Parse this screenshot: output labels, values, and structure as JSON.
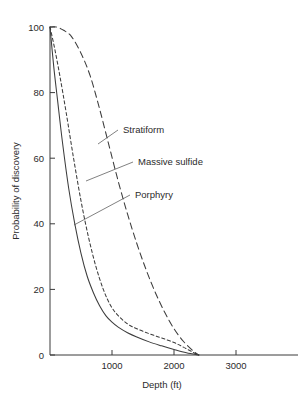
{
  "chart_data": {
    "type": "line",
    "title": "",
    "xlabel": "Depth (ft)",
    "ylabel": "Probability of discovery",
    "xlim": [
      0,
      4000
    ],
    "ylim": [
      0,
      100
    ],
    "xticks": [
      1000,
      2000,
      3000
    ],
    "xtick_labels": [
      "1000",
      "2000",
      "3000"
    ],
    "yticks": [
      0,
      20,
      40,
      60,
      80,
      100
    ],
    "ytick_labels": [
      "0",
      "20",
      "40",
      "60",
      "80",
      "100"
    ],
    "grid": false,
    "legend": "inline-annotations",
    "series": [
      {
        "name": "Porphyry",
        "style": "solid",
        "x": [
          0,
          60,
          120,
          200,
          300,
          400,
          500,
          600,
          700,
          800,
          900,
          1000,
          1100,
          1250,
          1400,
          1600,
          1800,
          2000,
          2200,
          2400
        ],
        "y": [
          100,
          88,
          78,
          65,
          51,
          40,
          31,
          24,
          19,
          15,
          12,
          10,
          8.5,
          6.8,
          5.5,
          4.0,
          2.8,
          1.7,
          0.7,
          0
        ]
      },
      {
        "name": "Massive sulfide",
        "style": "short-dash",
        "x": [
          0,
          80,
          160,
          260,
          380,
          500,
          620,
          740,
          860,
          980,
          1100,
          1250,
          1400,
          1600,
          1800,
          2000,
          2150,
          2300,
          2400
        ],
        "y": [
          100,
          93,
          85,
          74,
          60,
          47,
          36,
          27,
          20,
          15,
          12,
          9.5,
          8.0,
          6.5,
          5.2,
          3.8,
          2.4,
          0.9,
          0
        ]
      },
      {
        "name": "Stratiform",
        "style": "long-dash",
        "x": [
          0,
          100,
          220,
          350,
          500,
          650,
          800,
          950,
          1100,
          1250,
          1400,
          1550,
          1700,
          1850,
          2000,
          2150,
          2300,
          2400
        ],
        "y": [
          100,
          100,
          99,
          97,
          92,
          85,
          75,
          64,
          53,
          43,
          34,
          26,
          19,
          13,
          8,
          4.2,
          1.4,
          0
        ]
      }
    ],
    "annotations": [
      {
        "label": "Stratiform",
        "text_x": 123,
        "text_y": 133,
        "leader_from_x": 118,
        "leader_from_y": 130,
        "leader_to_x": 98,
        "leader_to_y": 144
      },
      {
        "label": "Massive sulfide",
        "text_x": 138,
        "text_y": 165,
        "leader_from_x": 133,
        "leader_from_y": 162,
        "leader_to_x": 86,
        "leader_to_y": 181
      },
      {
        "label": "Porphyry",
        "text_x": 135,
        "text_y": 198,
        "leader_from_x": 130,
        "leader_from_y": 195,
        "leader_to_x": 74,
        "leader_to_y": 225
      }
    ]
  },
  "axes": {
    "x_title": "Depth (ft)",
    "y_title": "Probability of discovery",
    "x_tick_0": "1000",
    "x_tick_1": "2000",
    "x_tick_2": "3000",
    "y_tick_0": "0",
    "y_tick_1": "20",
    "y_tick_2": "40",
    "y_tick_3": "60",
    "y_tick_4": "80",
    "y_tick_5": "100"
  },
  "labels": {
    "stratiform": "Stratiform",
    "massive_sulfide": "Massive sulfide",
    "porphyry": "Porphyry"
  },
  "colors": {
    "background": "#ffffff",
    "ink": "#3a3a3a",
    "text": "#2b2b2b"
  }
}
